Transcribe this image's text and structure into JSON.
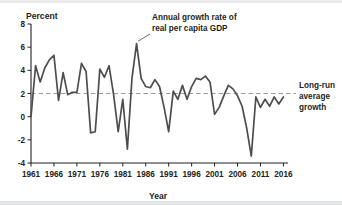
{
  "figure": {
    "ylabel": "Percent",
    "xlabel": "Year"
  },
  "annotations": {
    "series_label_line1": "Annual growth rate of",
    "series_label_line2": "real per capita GDP",
    "reference_label_line1": "Long-run",
    "reference_label_line2": "average",
    "reference_label_line3": "growth"
  },
  "colors": {
    "series": "#4d4d4f",
    "reference": "#9a9a9c",
    "axis": "#231f20",
    "background": "#ffffff"
  },
  "chart_data": {
    "type": "line",
    "title": "",
    "xlabel": "Year",
    "ylabel": "Percent",
    "xlim": [
      1961,
      2017
    ],
    "ylim": [
      -4,
      8
    ],
    "ytick_labels": [
      "8",
      "6",
      "4",
      "2",
      "0",
      "-2",
      "-4"
    ],
    "yticks": [
      8,
      6,
      4,
      2,
      0,
      -2,
      -4
    ],
    "xtick_labels": [
      "1961",
      "1966",
      "1971",
      "1976",
      "1981",
      "1986",
      "1991",
      "1996",
      "2001",
      "2006",
      "2011",
      "2016"
    ],
    "xticks": [
      1961,
      1966,
      1971,
      1976,
      1981,
      1986,
      1991,
      1996,
      2001,
      2006,
      2011,
      2016
    ],
    "grid": false,
    "legend_position": "annotation-callout",
    "reference_line": {
      "label": "Long-run average growth",
      "value": 2.0,
      "style": "dashed"
    },
    "series": [
      {
        "name": "Annual growth rate of real per capita GDP",
        "x": [
          1961,
          1962,
          1963,
          1964,
          1965,
          1966,
          1967,
          1968,
          1969,
          1970,
          1971,
          1972,
          1973,
          1974,
          1975,
          1976,
          1977,
          1978,
          1979,
          1980,
          1981,
          1982,
          1983,
          1984,
          1985,
          1986,
          1987,
          1988,
          1989,
          1990,
          1991,
          1992,
          1993,
          1994,
          1995,
          1996,
          1997,
          1998,
          1999,
          2000,
          2001,
          2002,
          2003,
          2004,
          2005,
          2006,
          2007,
          2008,
          2009,
          2010,
          2011,
          2012,
          2013,
          2014,
          2015,
          2016
        ],
        "values": [
          0.0,
          4.4,
          3.0,
          4.2,
          4.9,
          5.3,
          1.4,
          3.8,
          1.9,
          2.1,
          2.1,
          4.6,
          3.9,
          -1.4,
          -1.3,
          4.1,
          3.4,
          4.4,
          1.9,
          -1.3,
          1.5,
          -2.8,
          3.3,
          6.3,
          3.3,
          2.6,
          2.5,
          3.2,
          2.6,
          0.8,
          -1.3,
          2.2,
          1.5,
          2.7,
          1.5,
          2.6,
          3.3,
          3.2,
          3.5,
          3.0,
          0.2,
          0.8,
          1.8,
          2.7,
          2.4,
          1.8,
          0.9,
          -1.0,
          -3.4,
          1.7,
          0.8,
          1.5,
          0.9,
          1.7,
          1.1,
          1.7
        ]
      }
    ]
  }
}
